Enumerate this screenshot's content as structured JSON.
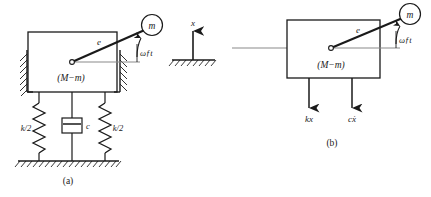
{
  "figure": {
    "title_a": "(a)",
    "title_b": "(b)",
    "stroke_color": "#1a1a1a",
    "reference_line_color": "#8a8a8a",
    "background": "#ffffff"
  },
  "diagram_a": {
    "caption": "(a)",
    "block_label": "(M−m)",
    "eccentricity_label": "e",
    "rotating_mass_label": "m",
    "angle_label": "ωƒt",
    "spring_left_label": "k/2",
    "spring_right_label": "k/2",
    "damper_label": "c",
    "wall_hatch_left": "hatch-left-wall",
    "wall_hatch_right": "hatch-right-wall",
    "ground_hatch": "hatch-ground"
  },
  "axis": {
    "label": "x",
    "direction": "up",
    "ground_hatch": "hatch-ground-axis"
  },
  "diagram_b": {
    "caption": "(b)",
    "block_label": "(M−m)",
    "eccentricity_label": "e",
    "rotating_mass_label": "m",
    "angle_label": "ωƒt",
    "force_spring_label": "kx",
    "force_damper_label": "cẋ"
  }
}
